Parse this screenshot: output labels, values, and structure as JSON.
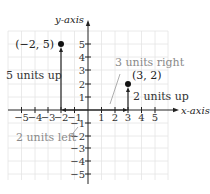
{
  "axes": {
    "x_label": "x-axis",
    "y_label": "y-axis",
    "x_ticks": [
      "−5",
      "−4",
      "−3",
      "−2",
      "−1",
      "1",
      "2",
      "3",
      "4",
      "5"
    ],
    "y_ticks": [
      "5",
      "4",
      "3",
      "2",
      "1",
      "−1",
      "−2",
      "−3",
      "−4",
      "−5"
    ]
  },
  "points": [
    {
      "label": "(−2, 5)",
      "x": -2,
      "y": 5
    },
    {
      "label": "(3, 2)",
      "x": 3,
      "y": 2
    }
  ],
  "annotations": {
    "five_up": "5 units up",
    "two_left": "2 units left",
    "three_right": "3 units right",
    "two_up": "2 units up"
  },
  "colors": {
    "grid": "#e4e4e4",
    "axis": "#222222",
    "annotation_text": "#8a8a8a",
    "point": "#111111"
  }
}
